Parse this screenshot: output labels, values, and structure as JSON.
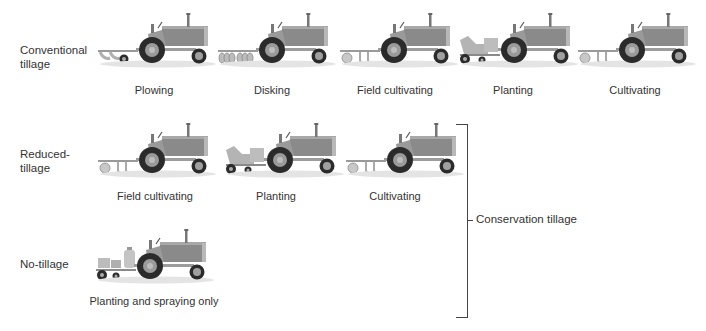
{
  "rows": [
    {
      "label": "Conventional\ntillage",
      "operations": [
        {
          "caption": "Plowing",
          "attachment": "plow"
        },
        {
          "caption": "Disking",
          "attachment": "disk"
        },
        {
          "caption": "Field cultivating",
          "attachment": "cultivator"
        },
        {
          "caption": "Planting",
          "attachment": "planter"
        },
        {
          "caption": "Cultivating",
          "attachment": "cultivator"
        }
      ]
    },
    {
      "label": "Reduced-\ntillage",
      "operations": [
        {
          "caption": "Field cultivating",
          "attachment": "cultivator"
        },
        {
          "caption": "Planting",
          "attachment": "planter"
        },
        {
          "caption": "Cultivating",
          "attachment": "cultivator"
        }
      ]
    },
    {
      "label": "No-tillage",
      "operations": [
        {
          "caption": "Planting and spraying only",
          "attachment": "sprayer-planter"
        }
      ]
    }
  ],
  "bracket": {
    "label": "Conservation tillage",
    "spans_rows": [
      "Reduced-tillage",
      "No-tillage"
    ]
  },
  "colors": {
    "body": "#8a8a8a",
    "body_light": "#a9a9a9",
    "wheel": "#2b2b2b",
    "hub": "#9a9a9a",
    "ground": "#e6e6e6",
    "text": "#333333"
  }
}
